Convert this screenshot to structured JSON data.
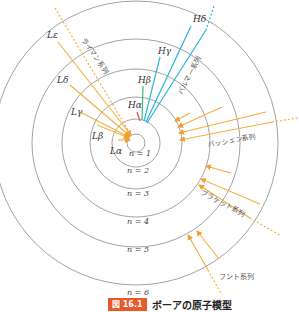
{
  "figure": {
    "caption_number": "図 16.1",
    "caption_title": "ボーアの原子模型",
    "center": [
      136,
      143
    ],
    "colors": {
      "orbit": "#8a8a8a",
      "lyman": "#f5b040",
      "balmer_alpha": "#d9465a",
      "balmer_beta": "#3cb878",
      "balmer": "#2bb5d8",
      "paschen": "#f5b040",
      "brackett": "#f5b040",
      "pfund": "#f5b040",
      "caption_badge": "#e8582a"
    },
    "orbits": [
      {
        "n": 1,
        "label": "n = 1",
        "r": 9
      },
      {
        "n": 2,
        "label": "n = 2",
        "r": 24
      },
      {
        "n": 3,
        "label": "n = 3",
        "r": 46
      },
      {
        "n": 4,
        "label": "n = 4",
        "r": 74
      },
      {
        "n": 5,
        "label": "n = 5",
        "r": 104
      },
      {
        "n": 6,
        "label": "n = 6",
        "r": 142
      }
    ],
    "series": [
      {
        "name": "ライマン系列",
        "lines": [
          "Lα",
          "Lβ",
          "Lγ",
          "Lδ",
          "Lε"
        ]
      },
      {
        "name": "バルマー系列",
        "lines": [
          "Hα",
          "Hβ",
          "Hγ",
          "Hδ"
        ]
      },
      {
        "name": "パッシェン系列"
      },
      {
        "name": "ブラケット系列"
      },
      {
        "name": "フント系列"
      }
    ],
    "labels": {
      "L_alpha": "Lα",
      "L_beta": "Lβ",
      "L_gamma": "Lγ",
      "L_delta": "Lδ",
      "L_epsilon": "Lε",
      "H_alpha": "Hα",
      "H_beta": "Hβ",
      "H_gamma": "Hγ",
      "H_delta": "Hδ",
      "lyman": "ライマン系列",
      "balmer": "バルマー系列",
      "paschen": "パッシェン系列",
      "brackett": "ブラケット系列",
      "pfund": "フント系列",
      "n1": "n = 1",
      "n2": "n = 2",
      "n3": "n = 3",
      "n4": "n = 4",
      "n5": "n = 5",
      "n6": "n = 6"
    }
  }
}
